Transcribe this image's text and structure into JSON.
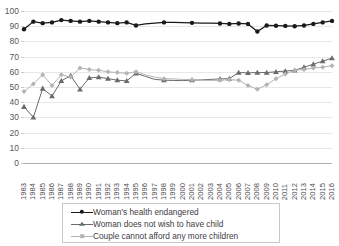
{
  "chart_data": {
    "type": "line",
    "title": "",
    "xlabel": "",
    "ylabel": "",
    "ylim": [
      0,
      100
    ],
    "ytick_step": 10,
    "yticks": [
      0,
      10,
      20,
      30,
      40,
      50,
      60,
      70,
      80,
      90,
      100
    ],
    "grid": true,
    "legend_position": "bottom",
    "categories": [
      "1983",
      "1984",
      "1985",
      "1986",
      "1987",
      "1988",
      "1989",
      "1990",
      "1991",
      "1992",
      "1993",
      "1994",
      "1995",
      "1996",
      "1997",
      "1998",
      "1999",
      "2000",
      "2001",
      "2002",
      "2003",
      "2004",
      "2005",
      "2006",
      "2007",
      "2008",
      "2009",
      "2010",
      "2011",
      "2012",
      "2013",
      "2014",
      "2015",
      "2016"
    ],
    "series": [
      {
        "name": "Woman's health endangered",
        "color": "#1a1a1a",
        "marker": "circle",
        "values": [
          88,
          93,
          92,
          92.5,
          94,
          93.5,
          93,
          93.5,
          93,
          92.5,
          92,
          92.5,
          90.5,
          91.5,
          92,
          92.5,
          92.5,
          92.3,
          92.2,
          92.1,
          92,
          91.8,
          91.5,
          91.8,
          91.5,
          86.5,
          90.5,
          90.3,
          90.2,
          90,
          90.5,
          91.5,
          92.5,
          93.5
        ]
      },
      {
        "name": "Woman does not wish to have child",
        "color": "#6b6b6b",
        "marker": "triangle",
        "values": [
          37,
          30,
          49,
          44,
          54,
          57.5,
          48.5,
          56,
          56.5,
          55.5,
          54.5,
          54,
          59,
          57,
          55,
          54.5,
          54.3,
          54.2,
          54.5,
          54.7,
          55,
          55.3,
          55.5,
          59.5,
          59.3,
          59.5,
          59.5,
          60,
          60.5,
          61,
          63,
          65,
          67,
          69
        ]
      },
      {
        "name": "Couple cannot afford any more children",
        "color": "#b4b4b4",
        "marker": "diamond",
        "values": [
          47,
          52,
          58,
          51,
          58,
          56.5,
          62.5,
          61.5,
          61,
          60,
          59.5,
          59,
          60,
          58,
          56.5,
          55.5,
          55.3,
          55,
          54.8,
          54.5,
          54.3,
          54.5,
          54.8,
          54.5,
          51,
          48.5,
          51.5,
          55.5,
          58.5,
          61,
          61.5,
          62.5,
          63,
          64
        ]
      }
    ]
  },
  "legend": {
    "items": [
      {
        "label": "Woman's health endangered",
        "color": "#1a1a1a",
        "marker": "circle"
      },
      {
        "label": "Woman does not wish to have child",
        "color": "#6b6b6b",
        "marker": "triangle"
      },
      {
        "label": "Couple cannot afford any more children",
        "color": "#b4b4b4",
        "marker": "diamond"
      }
    ]
  }
}
